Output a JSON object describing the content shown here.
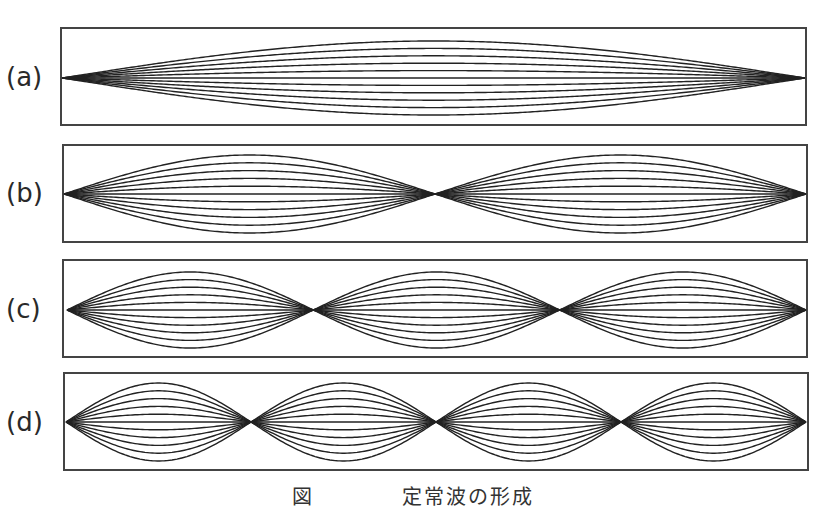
{
  "figure": {
    "caption": "図　　　　定常波の形成",
    "panels": [
      {
        "label": "(a)",
        "box": {
          "x": 61,
          "y": 28,
          "w": 745,
          "h": 97
        },
        "wave": {
          "x0": 62,
          "x1": 805,
          "cy": 78,
          "loops": 1,
          "amp": 37
        }
      },
      {
        "label": "(b)",
        "box": {
          "x": 63,
          "y": 145,
          "w": 744,
          "h": 97
        },
        "wave": {
          "x0": 64,
          "x1": 806,
          "cy": 194,
          "loops": 2,
          "amp": 39
        }
      },
      {
        "label": "(c)",
        "box": {
          "x": 63,
          "y": 260,
          "w": 744,
          "h": 97
        },
        "wave": {
          "x0": 67,
          "x1": 806,
          "cy": 310,
          "loops": 3,
          "amp": 38
        }
      },
      {
        "label": "(d)",
        "box": {
          "x": 64,
          "y": 373,
          "w": 744,
          "h": 97
        },
        "wave": {
          "x0": 66,
          "x1": 806,
          "cy": 422,
          "loops": 4,
          "amp": 39
        }
      }
    ],
    "curves_per_panel": 11,
    "line_color": "#222222",
    "box_color": "#444444"
  }
}
